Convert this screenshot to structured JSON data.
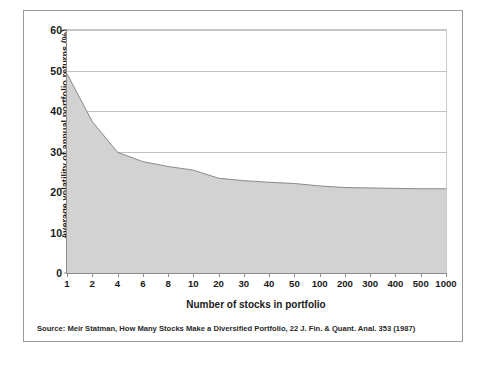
{
  "figure": {
    "y_axis_title": "Average volatility of annual portfolio returns (%)",
    "x_axis_title": "Number of stocks in portfolio",
    "source_note": "Source: Meir Statman, How Many Stocks Make a Diversified Portfolio, 22 J. Fin. & Quant. Anal. 353 (1987)"
  },
  "colors": {
    "area_fill": "#d2d2d2",
    "area_line": "#8a8a8a",
    "gridline": "#c2c2c2",
    "axis": "#8d8d8d",
    "frame": "#9a9a9a",
    "text": "#1a1a1a"
  },
  "chart_data": {
    "type": "area",
    "title": "",
    "subtitle": "",
    "xlabel": "Number of stocks in portfolio",
    "ylabel": "Average volatility of annual portfolio returns (%)",
    "categories": [
      "1",
      "2",
      "4",
      "6",
      "8",
      "10",
      "20",
      "30",
      "40",
      "50",
      "100",
      "200",
      "300",
      "400",
      "500",
      "1000"
    ],
    "values": [
      49.2,
      37.4,
      29.8,
      27.5,
      26.3,
      25.4,
      23.4,
      22.8,
      22.4,
      22.1,
      21.5,
      21.1,
      21.0,
      20.9,
      20.8,
      20.8
    ],
    "series": [
      {
        "name": "Average volatility of annual portfolio returns (%)",
        "values": [
          49.2,
          37.4,
          29.8,
          27.5,
          26.3,
          25.4,
          23.4,
          22.8,
          22.4,
          22.1,
          21.5,
          21.1,
          21.0,
          20.9,
          20.8,
          20.8
        ]
      }
    ],
    "ylim": [
      0,
      60
    ],
    "y_ticks": [
      0,
      10,
      20,
      30,
      40,
      50,
      60
    ],
    "y_tick_labels": [
      "0",
      "10",
      "20",
      "30",
      "40",
      "50",
      "60"
    ],
    "x_tick_labels": [
      "1",
      "2",
      "4",
      "6",
      "8",
      "10",
      "20",
      "30",
      "40",
      "50",
      "100",
      "200",
      "300",
      "400",
      "500",
      "1000"
    ],
    "grid": true,
    "grid_axis": "y",
    "legend": false,
    "legend_position": "none",
    "annotations": []
  }
}
